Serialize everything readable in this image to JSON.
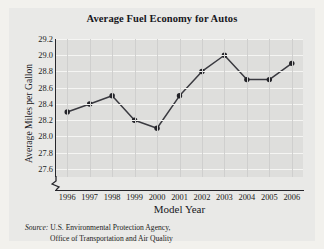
{
  "chart_data": {
    "type": "line",
    "title": "Average Fuel Economy for Autos",
    "xlabel": "Model Year",
    "ylabel": "Average Miles per Gallon",
    "categories": [
      "1996",
      "1997",
      "1998",
      "1999",
      "2000",
      "2001",
      "2002",
      "2003",
      "2004",
      "2005",
      "2006"
    ],
    "values": [
      28.3,
      28.4,
      28.5,
      28.2,
      28.1,
      28.5,
      28.8,
      29.0,
      28.7,
      28.7,
      28.9
    ],
    "series": [
      {
        "name": "Average Miles per Gallon",
        "values": [
          28.3,
          28.4,
          28.5,
          28.2,
          28.1,
          28.5,
          28.8,
          29.0,
          28.7,
          28.7,
          28.9
        ]
      }
    ],
    "ylim": [
      27.5,
      29.2
    ],
    "yticks": [
      "29.2",
      "29.0",
      "28.8",
      "28.6",
      "28.4",
      "28.2",
      "28.0",
      "27.8",
      "27.6"
    ],
    "ytick_values": [
      29.2,
      29.0,
      28.8,
      28.6,
      28.4,
      28.2,
      28.0,
      27.8,
      27.6
    ],
    "grid": true,
    "legend": "none",
    "axis_break": true,
    "marker": "filled-circle",
    "line_color": "#3a3a40",
    "marker_color": "#232328",
    "plot_background": "#dededc",
    "figure_background": "#e9e9e7"
  },
  "source": {
    "label": "Source:",
    "line1": "U.S. Environmental Protection Agency,",
    "line2": "Office of Transportation and Air Quality"
  }
}
